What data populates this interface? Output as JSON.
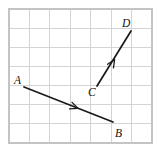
{
  "figure": {
    "background_color": "#ffffff",
    "width": 160,
    "height": 153
  },
  "grid": {
    "name": "square-grid",
    "line_color": "#cfcfcf",
    "border_color": "#c4c4c4",
    "left": 9,
    "top": 9,
    "right": 152,
    "bottom": 143,
    "columns": 7,
    "rows": 7,
    "cell_width": 20.43,
    "cell_height": 19.14,
    "x_positions": [
      9,
      29.4,
      49.9,
      70.3,
      90.7,
      111.1,
      131.6,
      152
    ],
    "y_positions": [
      9,
      28.1,
      47.3,
      66.4,
      85.6,
      104.7,
      123.9,
      143
    ]
  },
  "vectors": [
    {
      "id": "AB",
      "name": "vector-ab",
      "color": "#1a1a1a",
      "tail": {
        "label": "A",
        "x": 24,
        "y": 87
      },
      "head": {
        "label": "B",
        "x": 113,
        "y": 122
      },
      "arrowhead": {
        "x": 78,
        "y": 108.4,
        "direction": "down-right"
      },
      "direction": "down-right"
    },
    {
      "id": "CD",
      "name": "vector-cd",
      "color": "#1a1a1a",
      "tail": {
        "label": "C",
        "x": 97,
        "y": 86
      },
      "head": {
        "label": "D",
        "x": 131,
        "y": 31
      },
      "arrowhead": {
        "x": 114.6,
        "y": 59.5,
        "direction": "up-right"
      },
      "direction": "up-right"
    }
  ],
  "labels": [
    {
      "name": "label-a",
      "text": "A",
      "x": 14,
      "y": 84,
      "vector": "AB",
      "role": "tail"
    },
    {
      "name": "label-b",
      "text": "B",
      "x": 115,
      "y": 137,
      "vector": "AB",
      "role": "head"
    },
    {
      "name": "label-c",
      "text": "C",
      "x": 88,
      "y": 96,
      "vector": "CD",
      "role": "tail"
    },
    {
      "name": "label-d",
      "text": "D",
      "x": 122,
      "y": 27,
      "vector": "CD",
      "role": "head"
    }
  ]
}
